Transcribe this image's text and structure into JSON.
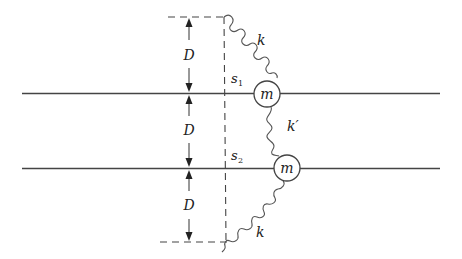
{
  "diagram": {
    "type": "coupled-oscillator",
    "labels": {
      "dim_top": "D",
      "dim_middle": "D",
      "dim_bottom": "D",
      "spring_top": "k",
      "spring_middle": "k′",
      "spring_bottom": "k",
      "disp_1": "s",
      "disp_1_sub": "1",
      "disp_2": "s",
      "disp_2_sub": "2",
      "mass_1": "m",
      "mass_2": "m"
    },
    "colors": {
      "line": "#444444",
      "background": "#ffffff"
    }
  }
}
